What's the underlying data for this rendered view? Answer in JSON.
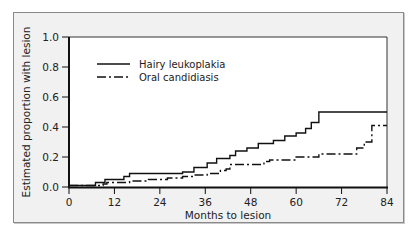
{
  "chart_data": {
    "type": "line",
    "subtype": "step (Kaplan-Meier cumulative incidence)",
    "title": "",
    "xlabel": "Months to lesion",
    "ylabel": "Estimated proportion with lesion",
    "xlim": [
      0,
      84
    ],
    "ylim": [
      0.0,
      1.0
    ],
    "x_ticks": [
      0,
      12,
      24,
      36,
      48,
      60,
      72,
      84
    ],
    "y_ticks": [
      "0.0",
      "0.2",
      "0.4",
      "0.6",
      "0.8",
      "1.0"
    ],
    "grid": false,
    "legend_position": "upper left (inside)",
    "series": [
      {
        "name": "Hairy leukoplakia",
        "line_style": "solid",
        "color": "#111111",
        "x": [
          0,
          7,
          9.5,
          14.5,
          16,
          25.5,
          30,
          33,
          36.5,
          39,
          42.5,
          44,
          47,
          50,
          54,
          57,
          60,
          62.5,
          64,
          66,
          84
        ],
        "y": [
          0.01,
          0.03,
          0.05,
          0.07,
          0.09,
          0.09,
          0.1,
          0.13,
          0.16,
          0.19,
          0.21,
          0.24,
          0.26,
          0.29,
          0.31,
          0.34,
          0.36,
          0.39,
          0.43,
          0.5,
          0.5
        ]
      },
      {
        "name": "Oral candidiasis",
        "line_style": "dash-dot",
        "color": "#111111",
        "x": [
          0,
          9,
          10,
          16,
          21,
          26,
          30,
          33,
          36.5,
          40,
          41.5,
          42.5,
          50,
          51.5,
          53,
          60,
          66,
          74.5,
          76,
          78,
          80,
          84
        ],
        "y": [
          0.01,
          0.02,
          0.03,
          0.04,
          0.05,
          0.06,
          0.07,
          0.08,
          0.09,
          0.11,
          0.12,
          0.15,
          0.15,
          0.17,
          0.18,
          0.2,
          0.22,
          0.22,
          0.26,
          0.3,
          0.41,
          0.41
        ]
      }
    ]
  },
  "legend": {
    "items": [
      {
        "label": "Hairy leukoplakia",
        "style": "solid"
      },
      {
        "label": "Oral candidiasis",
        "style": "dash-dot"
      }
    ]
  },
  "axes": {
    "xlabel": "Months to lesion",
    "ylabel": "Estimated proportion with lesion",
    "x_tick_labels": [
      "0",
      "12",
      "24",
      "36",
      "48",
      "60",
      "72",
      "84"
    ],
    "y_tick_labels": [
      "0.0",
      "0.2",
      "0.4",
      "0.6",
      "0.8",
      "1.0"
    ]
  },
  "colors": {
    "background": "#ffffff",
    "frame_fill": "#f1f1f1",
    "plot_fill": "#ffffff",
    "ink": "#111111"
  }
}
